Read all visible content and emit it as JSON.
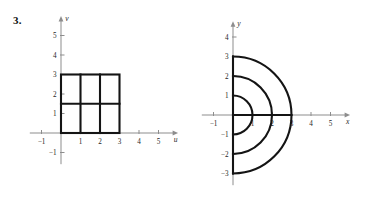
{
  "problem": {
    "number": "3."
  },
  "figures": {
    "left": {
      "name": "uv-plane-region",
      "x_axis_label": "u",
      "y_axis_label": "v",
      "x_ticks": [
        {
          "value": -1,
          "label": "−1"
        },
        {
          "value": 1,
          "label": "1"
        },
        {
          "value": 2,
          "label": "2"
        },
        {
          "value": 3,
          "label": "3"
        },
        {
          "value": 4,
          "label": "4"
        },
        {
          "value": 5,
          "label": "5"
        }
      ],
      "y_ticks": [
        {
          "value": -1,
          "label": "−1"
        },
        {
          "value": 1,
          "label": "1"
        },
        {
          "value": 2,
          "label": "2"
        },
        {
          "value": 3,
          "label": "3"
        },
        {
          "value": 4,
          "label": "4"
        },
        {
          "value": 5,
          "label": "5"
        }
      ],
      "xlim": [
        -1.6,
        5.8
      ],
      "ylim": [
        -1.6,
        5.8
      ],
      "rectangle": {
        "u_min": 0,
        "u_max": 3,
        "v_min": 0,
        "v_max": 3
      },
      "interior_vertical_lines": [
        1,
        2
      ],
      "interior_horizontal_lines": [
        1.5
      ]
    },
    "right": {
      "name": "xy-plane-image",
      "x_axis_label": "x",
      "y_axis_label": "y",
      "x_ticks": [
        {
          "value": -1,
          "label": "−1"
        },
        {
          "value": 1,
          "label": "1"
        },
        {
          "value": 2,
          "label": "2"
        },
        {
          "value": 3,
          "label": "3"
        },
        {
          "value": 4,
          "label": "4"
        },
        {
          "value": 5,
          "label": "5"
        }
      ],
      "y_ticks": [
        {
          "value": -3,
          "label": "−3"
        },
        {
          "value": -2,
          "label": "−2"
        },
        {
          "value": -1,
          "label": "−1"
        },
        {
          "value": 1,
          "label": "1"
        },
        {
          "value": 2,
          "label": "2"
        },
        {
          "value": 3,
          "label": "3"
        },
        {
          "value": 4,
          "label": "4"
        }
      ],
      "xlim": [
        -1.6,
        5.8
      ],
      "ylim": [
        -3.6,
        4.6
      ],
      "semicircle_radii": [
        1,
        2,
        3
      ],
      "semicircle_side": "right",
      "vertical_segment": {
        "x": 0,
        "y_min": -3,
        "y_max": 3
      },
      "horizontal_segment": {
        "y": 0,
        "x_min": 0,
        "x_max": 3
      }
    }
  },
  "chart_data": [
    {
      "type": "line",
      "title": "",
      "xlabel": "u",
      "ylabel": "v",
      "xlim": [
        -1.6,
        5.8
      ],
      "ylim": [
        -1.6,
        5.8
      ],
      "grid": false,
      "legend": "none",
      "description": "Bold square region in the uv-plane from (0,0) to (3,3), subdivided by vertical lines at u=1 and u=2 and a horizontal line at v=1.5.",
      "series": [
        {
          "name": "outer-rectangle",
          "x": [
            0,
            3,
            3,
            0,
            0
          ],
          "y": [
            0,
            0,
            3,
            3,
            0
          ]
        },
        {
          "name": "vertical-u-1",
          "x": [
            1,
            1
          ],
          "y": [
            0,
            3
          ]
        },
        {
          "name": "vertical-u-2",
          "x": [
            2,
            2
          ],
          "y": [
            0,
            3
          ]
        },
        {
          "name": "horizontal-v-1.5",
          "x": [
            0,
            3
          ],
          "y": [
            1.5,
            1.5
          ]
        }
      ]
    },
    {
      "type": "line",
      "title": "",
      "xlabel": "x",
      "ylabel": "y",
      "xlim": [
        -1.6,
        5.8
      ],
      "ylim": [
        -3.6,
        4.6
      ],
      "grid": false,
      "legend": "none",
      "description": "Three bold right-half semicircles centered at the origin with radii 1, 2 and 3, together with the bold segment of the y-axis from y=-3 to y=3 and the bold segment of the x-axis from x=0 to x=3.",
      "series": [
        {
          "name": "semicircle-r1",
          "radius": 1,
          "center": [
            0,
            0
          ],
          "theta_deg": [
            -90,
            90
          ]
        },
        {
          "name": "semicircle-r2",
          "radius": 2,
          "center": [
            0,
            0
          ],
          "theta_deg": [
            -90,
            90
          ]
        },
        {
          "name": "semicircle-r3",
          "radius": 3,
          "center": [
            0,
            0
          ],
          "theta_deg": [
            -90,
            90
          ]
        },
        {
          "name": "vertical-axis-segment",
          "x": [
            0,
            0
          ],
          "y": [
            -3,
            3
          ]
        },
        {
          "name": "horizontal-axis-segment",
          "x": [
            0,
            3
          ],
          "y": [
            0,
            0
          ]
        }
      ]
    }
  ]
}
